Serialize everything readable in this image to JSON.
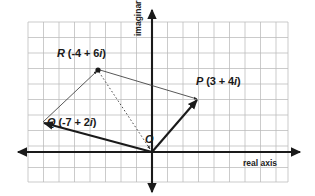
{
  "figure": {
    "type": "complex-plane-vector-diagram",
    "background": "#ffffff",
    "grid_color": "#b9b9b9",
    "axis_color": "#1a1a1a",
    "vector_color": "#1a1a1a",
    "thin_line_color": "#4a4a4a"
  },
  "axes": {
    "real_label": "real axis",
    "imaginary_label": "imaginary axis",
    "origin_label": "O"
  },
  "points": [
    {
      "name": "P",
      "label": "P (3 + 4i)",
      "letter": "P",
      "expr": "(3 + 4i)",
      "re": 3,
      "im": 4,
      "x": 198,
      "y": 100
    },
    {
      "name": "Q",
      "label": "Q (-7 + 2i)",
      "letter": "Q",
      "expr": "(-7 + 2i)",
      "re": -7,
      "im": 2,
      "x": 42,
      "y": 123
    },
    {
      "name": "R",
      "label": "R (-4 + 6i)",
      "letter": "R",
      "expr": "(-4 + 6i)",
      "re": -4,
      "im": 6,
      "x": 98,
      "y": 70
    }
  ],
  "chart_data": {
    "type": "scatter",
    "title": "",
    "xlabel": "real axis",
    "ylabel": "imaginary axis",
    "grid": true,
    "legend": "none",
    "origin_px": [
      152,
      152
    ],
    "cell_px": 15.5,
    "xlim": [
      -8,
      8.8
    ],
    "ylim": [
      -2,
      8.4
    ],
    "series": [
      {
        "name": "points",
        "points": [
          {
            "label": "P",
            "re": 3,
            "im": 4
          },
          {
            "label": "Q",
            "re": -7,
            "im": 2
          },
          {
            "label": "R",
            "re": -4,
            "im": 6
          }
        ]
      }
    ],
    "vectors": [
      {
        "name": "OP",
        "from": "O",
        "to": "P",
        "style": "solid-thick",
        "arrow": "end"
      },
      {
        "name": "OQ",
        "from": "O",
        "to": "Q",
        "style": "solid-thick",
        "arrow": "end"
      },
      {
        "name": "QR",
        "from": "Q",
        "to": "R",
        "style": "solid-thin",
        "arrow": "end"
      },
      {
        "name": "RP",
        "from": "R",
        "to": "P",
        "style": "solid-thin",
        "arrow": "end"
      },
      {
        "name": "RO",
        "from": "R",
        "to": "O",
        "style": "dotted-thin",
        "arrow": "end"
      }
    ]
  }
}
